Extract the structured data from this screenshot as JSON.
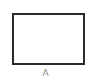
{
  "diagram": {
    "shape": {
      "type": "rectangle",
      "fill": "#ffffff",
      "stroke": "#2a2a2a",
      "label": "A"
    },
    "label_color": "#8a8a8a"
  }
}
